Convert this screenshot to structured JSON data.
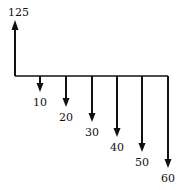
{
  "diagram": {
    "type": "cash-flow-diagram",
    "inflow": {
      "label": "125",
      "x": 15
    },
    "baseline": {
      "y": 76,
      "x_start": 15,
      "x_end": 168
    },
    "outflows": [
      {
        "label": "10",
        "x": 40,
        "tip": 92
      },
      {
        "label": "20",
        "x": 66,
        "tip": 107
      },
      {
        "label": "30",
        "x": 92,
        "tip": 122
      },
      {
        "label": "40",
        "x": 117,
        "tip": 137
      },
      {
        "label": "50",
        "x": 142,
        "tip": 152
      },
      {
        "label": "60",
        "x": 168,
        "tip": 168
      }
    ],
    "color": "#111111"
  }
}
